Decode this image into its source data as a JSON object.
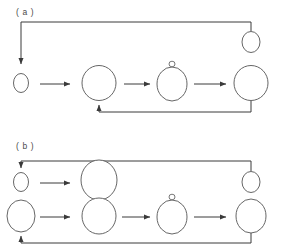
{
  "figure": {
    "background_color": "#ffffff",
    "stroke_color": "#3a3a3a",
    "cell_stroke_color": "#555555",
    "width": 282,
    "height": 250
  },
  "panels": [
    {
      "id": "panel-a",
      "label": "( a )",
      "label_x": 16,
      "label_y": 15,
      "description": "Single-row pathway with recycle loop to top-right daughter cell and feedback loop to second cell",
      "cells": [
        {
          "name": "cell-a1",
          "role": "small-start-cell",
          "cx": 21,
          "cy": 83,
          "rx": 7.5,
          "ry": 9.5,
          "bud": null
        },
        {
          "name": "cell-a2",
          "role": "enlarged-cell",
          "cx": 99,
          "cy": 83,
          "rx": 17,
          "ry": 17.5,
          "bud": null
        },
        {
          "name": "cell-a3",
          "role": "budding-cell",
          "cx": 172,
          "cy": 84,
          "rx": 15,
          "ry": 17,
          "bud": {
            "cx": 172,
            "cy": 64,
            "rx": 3,
            "ry": 2.8
          }
        },
        {
          "name": "cell-a4",
          "role": "enlarged-cell-final",
          "cx": 251,
          "cy": 83,
          "rx": 17,
          "ry": 17.5,
          "bud": null
        },
        {
          "name": "cell-a5",
          "role": "daughter-cell-top",
          "cx": 251,
          "cy": 42,
          "rx": 9,
          "ry": 10.5,
          "bud": null
        }
      ],
      "arrows": [
        {
          "name": "arrow-a1",
          "from": "cell-a1",
          "to": "cell-a2",
          "x1": 40,
          "y1": 84,
          "x2": 72,
          "y2": 84
        },
        {
          "name": "arrow-a2",
          "from": "cell-a2",
          "to": "cell-a3",
          "x1": 124,
          "y1": 84,
          "x2": 152,
          "y2": 84
        },
        {
          "name": "arrow-a3",
          "from": "cell-a3",
          "to": "cell-a4",
          "x1": 194,
          "y1": 84,
          "x2": 228,
          "y2": 84
        }
      ],
      "loops": [
        {
          "name": "recycle-loop-a-top",
          "description": "From top-right down-left to start cell (a1)",
          "path": "M 251 31 L 251 22 L 21 22 L 21 66",
          "arrowhead_at": {
            "x": 21,
            "y": 68,
            "direction": "down"
          }
        },
        {
          "name": "feedback-loop-a-bottom",
          "description": "From bottom of final cell (a4) left to second cell (a2)",
          "path": "M 251 101 L 251 112 L 99 112 L 99 103",
          "arrowhead_at": {
            "x": 99,
            "y": 101,
            "direction": "up"
          }
        }
      ]
    },
    {
      "id": "panel-b",
      "label": "( b )",
      "label_x": 16,
      "label_y": 149,
      "description": "Two-row pathway; upper row is short-cycle branch, lower row is full budding cycle, both feeding back to the left",
      "cells": [
        {
          "name": "cell-b-top-1",
          "role": "small-start-cell",
          "cx": 21,
          "cy": 182,
          "rx": 7.5,
          "ry": 9.5,
          "bud": null
        },
        {
          "name": "cell-b-top-2",
          "role": "enlarged-cell",
          "cx": 99,
          "cy": 180,
          "rx": 18,
          "ry": 20,
          "bud": null
        },
        {
          "name": "cell-b-top-3",
          "role": "daughter-cell-right",
          "cx": 251,
          "cy": 182,
          "rx": 9,
          "ry": 10.5,
          "bud": null
        },
        {
          "name": "cell-b-bot-1",
          "role": "medium-start-cell",
          "cx": 21,
          "cy": 216,
          "rx": 14,
          "ry": 16
        },
        {
          "name": "cell-b-bot-2",
          "role": "enlarged-cell",
          "cx": 99,
          "cy": 216,
          "rx": 17,
          "ry": 18,
          "bud": null
        },
        {
          "name": "cell-b-bot-3",
          "role": "budding-cell",
          "cx": 172,
          "cy": 217,
          "rx": 15,
          "ry": 17,
          "bud": {
            "cx": 172,
            "cy": 197,
            "rx": 3,
            "ry": 2.8
          }
        },
        {
          "name": "cell-b-bot-4",
          "role": "enlarged-cell-final",
          "cx": 251,
          "cy": 216,
          "rx": 15,
          "ry": 17,
          "bud": null
        }
      ],
      "arrows": [
        {
          "name": "arrow-b-top-1",
          "from": "cell-b-top-1",
          "to": "cell-b-top-2",
          "x1": 40,
          "y1": 183,
          "x2": 72,
          "y2": 183
        },
        {
          "name": "arrow-b-bot-1",
          "from": "cell-b-bot-1",
          "to": "cell-b-bot-2",
          "x1": 40,
          "y1": 217,
          "x2": 72,
          "y2": 217
        },
        {
          "name": "arrow-b-bot-2",
          "from": "cell-b-bot-2",
          "to": "cell-b-bot-3",
          "x1": 122,
          "y1": 217,
          "x2": 152,
          "y2": 217
        },
        {
          "name": "arrow-b-bot-3",
          "from": "cell-b-bot-3",
          "to": "cell-b-bot-4",
          "x1": 194,
          "y1": 217,
          "x2": 228,
          "y2": 217
        }
      ],
      "loops": [
        {
          "name": "recycle-loop-b-top",
          "description": "From top-right daughter cell up and left, arrow down to small start cell",
          "path": "M 251 171 L 251 161 L 21 161 L 21 170",
          "arrowhead_at": {
            "x": 21,
            "y": 172,
            "direction": "down"
          }
        },
        {
          "name": "feedback-loop-b-bottom",
          "description": "From bottom of final cell left and up into medium start cell",
          "path": "M 251 233 L 251 243 L 21 243 L 21 234",
          "arrowhead_at": {
            "x": 21,
            "y": 232,
            "direction": "up"
          }
        }
      ]
    }
  ],
  "legend": {
    "visible": false,
    "items": []
  }
}
